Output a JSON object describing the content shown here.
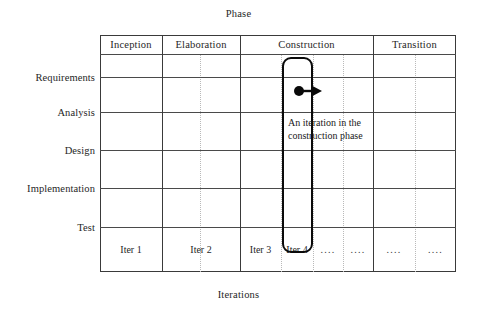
{
  "diagram": {
    "top_axis_title": "Phase",
    "bottom_axis_title": "Iterations",
    "colors": {
      "ink": "#1a1a1a",
      "grid_major": "#3a3a3a",
      "grid_row": "#4a4a4a",
      "grid_dotted": "#b9b9b9",
      "highlight": "#0a0a0a",
      "background": "#ffffff"
    }
  },
  "disciplines": [
    {
      "label": "Requirements"
    },
    {
      "label": "Analysis"
    },
    {
      "label": "Design"
    },
    {
      "label": "Implementation"
    },
    {
      "label": "Test"
    }
  ],
  "phases": [
    {
      "label": "Inception"
    },
    {
      "label": "Elaboration"
    },
    {
      "label": "Construction"
    },
    {
      "label": "Transition"
    }
  ],
  "iterations": [
    {
      "label": "Iter 1"
    },
    {
      "label": "Iter 2"
    },
    {
      "label": "Iter 3"
    },
    {
      "label": "Iter 4"
    },
    {
      "label": "...."
    },
    {
      "label": "...."
    },
    {
      "label": "...."
    },
    {
      "label": "...."
    }
  ],
  "annotation": {
    "text": "An iteration in the\nconstruction phase",
    "marker_icon": "dot-arrow-right-icon"
  },
  "highlight": {
    "name": "construction-iteration-4"
  }
}
